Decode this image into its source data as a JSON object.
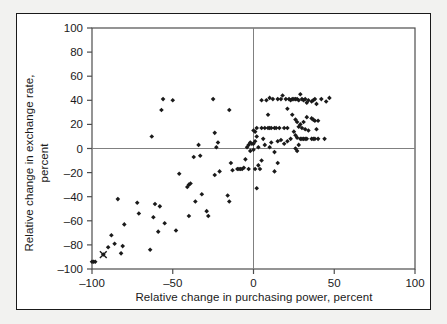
{
  "chart_data": {
    "type": "scatter",
    "title": "",
    "xlabel": "Relative change in purchasing power, percent",
    "ylabel": "Relative change in exchange rate, percent",
    "xlim": [
      -100,
      100
    ],
    "ylim": [
      -100,
      100
    ],
    "xticks": [
      -100,
      -50,
      0,
      50,
      100
    ],
    "yticks": [
      -100,
      -80,
      -60,
      -40,
      -20,
      0,
      20,
      40,
      60,
      80,
      100
    ],
    "xtick_labels": [
      "–100",
      "–50",
      "0",
      "50",
      "100"
    ],
    "ytick_labels": [
      "–100",
      "–80",
      "–60",
      "–40",
      "–20",
      "0",
      "20",
      "40",
      "60",
      "80",
      "100"
    ],
    "grid": false,
    "zero_lines": true,
    "legend": null,
    "marker": "diamond",
    "marker_color": "#1a1a1a",
    "points": [
      [
        -100,
        -94
      ],
      [
        -99,
        -94
      ],
      [
        -98,
        -94
      ],
      [
        -93,
        -88
      ],
      [
        -90,
        -82
      ],
      [
        -88,
        -72
      ],
      [
        -86,
        -79
      ],
      [
        -84,
        -42
      ],
      [
        -82,
        -87
      ],
      [
        -81,
        -81
      ],
      [
        -80,
        -63
      ],
      [
        -72,
        -45
      ],
      [
        -71,
        -54
      ],
      [
        -64,
        -84
      ],
      [
        -63,
        10
      ],
      [
        -62,
        -57
      ],
      [
        -61,
        -46
      ],
      [
        -59,
        -69
      ],
      [
        -58,
        -48
      ],
      [
        -57,
        32
      ],
      [
        -56,
        41
      ],
      [
        -55,
        -62
      ],
      [
        -50,
        40
      ],
      [
        -48,
        -68
      ],
      [
        -46,
        -21
      ],
      [
        -41,
        -32
      ],
      [
        -40,
        -30
      ],
      [
        -40,
        -56
      ],
      [
        -39,
        -29
      ],
      [
        -37,
        -7
      ],
      [
        -36,
        -44
      ],
      [
        -34,
        3
      ],
      [
        -33,
        -6
      ],
      [
        -32,
        -38
      ],
      [
        -29,
        -52
      ],
      [
        -28,
        -56
      ],
      [
        -25,
        41
      ],
      [
        -24,
        13
      ],
      [
        -24,
        -22
      ],
      [
        -23,
        1
      ],
      [
        -22,
        5
      ],
      [
        -21,
        -19
      ],
      [
        -16,
        -39
      ],
      [
        -15,
        32
      ],
      [
        -15,
        -44
      ],
      [
        -14,
        -12
      ],
      [
        -13,
        -18
      ],
      [
        -10,
        -17
      ],
      [
        -9,
        -17
      ],
      [
        -8,
        -17
      ],
      [
        -7,
        -17
      ],
      [
        -6,
        -16
      ],
      [
        -5,
        -9
      ],
      [
        -4,
        1
      ],
      [
        -3,
        3
      ],
      [
        -3,
        -17
      ],
      [
        -2,
        5
      ],
      [
        -2,
        -2
      ],
      [
        -1,
        4
      ],
      [
        0,
        15
      ],
      [
        0,
        4
      ],
      [
        0,
        -1
      ],
      [
        1,
        14
      ],
      [
        1,
        6
      ],
      [
        1,
        -17
      ],
      [
        2,
        17
      ],
      [
        2,
        10
      ],
      [
        2,
        -33
      ],
      [
        3,
        1
      ],
      [
        3,
        -14
      ],
      [
        4,
        -17
      ],
      [
        5,
        40
      ],
      [
        5,
        17
      ],
      [
        5,
        -10
      ],
      [
        6,
        8
      ],
      [
        7,
        17
      ],
      [
        7,
        3
      ],
      [
        8,
        40
      ],
      [
        9,
        28
      ],
      [
        9,
        17
      ],
      [
        10,
        42
      ],
      [
        10,
        17
      ],
      [
        10,
        1
      ],
      [
        11,
        17
      ],
      [
        11,
        5
      ],
      [
        12,
        41
      ],
      [
        13,
        17
      ],
      [
        13,
        -3
      ],
      [
        13,
        -19
      ],
      [
        14,
        17
      ],
      [
        15,
        41
      ],
      [
        15,
        6
      ],
      [
        15,
        -12
      ],
      [
        16,
        17
      ],
      [
        17,
        41
      ],
      [
        17,
        7
      ],
      [
        18,
        44
      ],
      [
        19,
        17
      ],
      [
        19,
        4
      ],
      [
        20,
        41
      ],
      [
        21,
        33
      ],
      [
        21,
        17
      ],
      [
        21,
        6
      ],
      [
        22,
        41
      ],
      [
        23,
        40
      ],
      [
        23,
        8
      ],
      [
        24,
        41
      ],
      [
        24,
        28
      ],
      [
        25,
        41
      ],
      [
        25,
        14
      ],
      [
        26,
        41
      ],
      [
        26,
        24
      ],
      [
        26,
        11
      ],
      [
        26,
        0
      ],
      [
        27,
        41
      ],
      [
        27,
        22
      ],
      [
        27,
        9
      ],
      [
        27,
        -2
      ],
      [
        28,
        40
      ],
      [
        28,
        18
      ],
      [
        28,
        3
      ],
      [
        29,
        45
      ],
      [
        29,
        20
      ],
      [
        29,
        8
      ],
      [
        30,
        41
      ],
      [
        30,
        17
      ],
      [
        30,
        8
      ],
      [
        31,
        40
      ],
      [
        31,
        22
      ],
      [
        31,
        8
      ],
      [
        32,
        41
      ],
      [
        32,
        16
      ],
      [
        32,
        8
      ],
      [
        33,
        38
      ],
      [
        33,
        26
      ],
      [
        33,
        8
      ],
      [
        34,
        40
      ],
      [
        34,
        15
      ],
      [
        36,
        39
      ],
      [
        36,
        25
      ],
      [
        36,
        8
      ],
      [
        37,
        40
      ],
      [
        37,
        24
      ],
      [
        37,
        8
      ],
      [
        38,
        41
      ],
      [
        38,
        23
      ],
      [
        38,
        8
      ],
      [
        39,
        37
      ],
      [
        39,
        16
      ],
      [
        40,
        23
      ],
      [
        40,
        8
      ],
      [
        42,
        41
      ],
      [
        44,
        8
      ],
      [
        45,
        39
      ],
      [
        47,
        42
      ]
    ],
    "special_marker": {
      "symbol": "x",
      "label": "x-marker",
      "point": [
        -93,
        -88
      ]
    }
  }
}
